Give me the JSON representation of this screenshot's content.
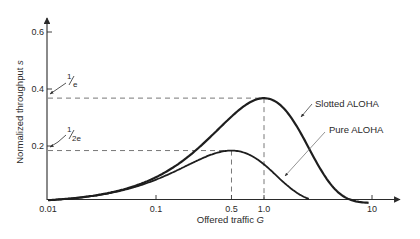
{
  "chart_data": {
    "type": "line",
    "title": "",
    "xlabel": "Offered traffic G",
    "xlabel_main": "Offered traffic ",
    "xlabel_var": "G",
    "ylabel": "Normalized throughput s",
    "ylabel_main": "Normalized throughput ",
    "ylabel_var": "s",
    "x_scale": "log",
    "xlim": [
      0.01,
      15
    ],
    "ylim": [
      0,
      0.65
    ],
    "x_ticks": [
      0.01,
      0.1,
      0.5,
      1.0,
      10
    ],
    "x_tick_labels": [
      "0.01",
      "0.1",
      "0.5",
      "1.0",
      "10"
    ],
    "y_ticks": [
      0.2,
      0.4,
      0.6
    ],
    "y_tick_labels": [
      "0.2",
      "0.4",
      "0.6"
    ],
    "grid": false,
    "legend": "inline labels with leader arrows, right side",
    "series": [
      {
        "name": "Slotted ALOHA",
        "formula": "S = G*exp(-G)",
        "x": [
          0.01,
          0.02,
          0.05,
          0.1,
          0.2,
          0.3,
          0.5,
          0.7,
          1.0,
          1.5,
          2.0,
          3.0,
          5.0,
          8.0,
          9.5
        ],
        "values": [
          0.0099,
          0.0196,
          0.0476,
          0.0905,
          0.1637,
          0.2222,
          0.3033,
          0.3476,
          0.3679,
          0.3347,
          0.2707,
          0.1494,
          0.0337,
          0.0027,
          0.0007
        ],
        "peak": {
          "G": 1.0,
          "S": 0.368
        }
      },
      {
        "name": "Pure ALOHA",
        "formula": "S = G*exp(-2G)",
        "x": [
          0.01,
          0.02,
          0.05,
          0.1,
          0.2,
          0.3,
          0.5,
          0.7,
          1.0,
          1.5,
          2.0,
          3.0,
          4.5
        ],
        "values": [
          0.0098,
          0.0192,
          0.0452,
          0.0819,
          0.1341,
          0.1646,
          0.1839,
          0.1726,
          0.1353,
          0.0747,
          0.0366,
          0.0074,
          0.0006
        ],
        "peak": {
          "G": 0.5,
          "S": 0.184
        }
      }
    ],
    "annotations": [
      {
        "text": "1/e",
        "numerator": "1",
        "denominator": "e",
        "y": 0.368,
        "dashed_to_G": 1.0
      },
      {
        "text": "1/2e",
        "numerator": "1",
        "denominator": "2e",
        "y": 0.184,
        "dashed_to_G": 0.5
      }
    ]
  }
}
